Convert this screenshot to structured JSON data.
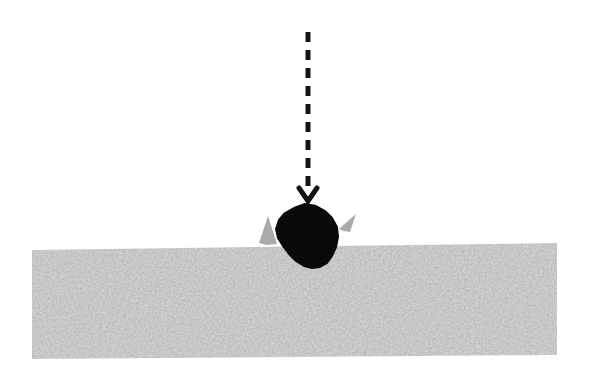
{
  "scene": {
    "title": "Meteorite impact on granular surface",
    "width": 589,
    "height": 381,
    "background_color": "#ffffff"
  },
  "colors": {
    "background": "#ffffff",
    "impactor": "#0a0a0a",
    "arrow": "#141414",
    "ground_base": "#b2b2b2",
    "ground_speckle_dark": "#6e6e6e",
    "ground_speckle_light": "#dcdcdc",
    "ejecta": "#9e9e9e"
  },
  "trajectory_arrow": {
    "label": "impact-trajectory",
    "orientation": "vertical-downward",
    "x": 308,
    "y_start": 32,
    "y_end": 190,
    "stroke_width": 5,
    "dash_length": 10,
    "dash_gap": 8,
    "dash_count": 10,
    "arrowhead": {
      "shape": "chevron",
      "tip_x": 308,
      "tip_y": 201,
      "half_width": 9,
      "height": 13
    }
  },
  "impactor": {
    "label": "impactor-body",
    "shape": "irregular-polygon",
    "center_x": 307,
    "center_y": 236,
    "bounds": {
      "x_min": 276,
      "x_max": 338,
      "y_min": 204,
      "y_max": 268
    },
    "points": "305,204 316,206 325,211 332,218 337,227 338,237 336,247 332,256 327,263 320,267 312,268 304,266 296,261 289,254 283,246 278,238 276,229 279,220 285,213 294,208"
  },
  "ejecta": [
    {
      "label": "ejecta-spray-left",
      "side": "left",
      "points": "277,244 268,216 259,243 266,245"
    },
    {
      "label": "ejecta-spray-right",
      "side": "right",
      "points": "339,229 356,214 350,232 344,231"
    }
  ],
  "ground": {
    "label": "granular-ground-slab",
    "description": "speckled granular regolith slab",
    "corners": "32,250 557,243 557,355 32,359",
    "surface_y_left": 250,
    "surface_y_right": 243,
    "bottom_y_left": 359,
    "bottom_y_right": 355,
    "left_x": 32,
    "right_x": 557,
    "crater_notch": "286,248 296,258 307,264 318,258 328,247"
  }
}
